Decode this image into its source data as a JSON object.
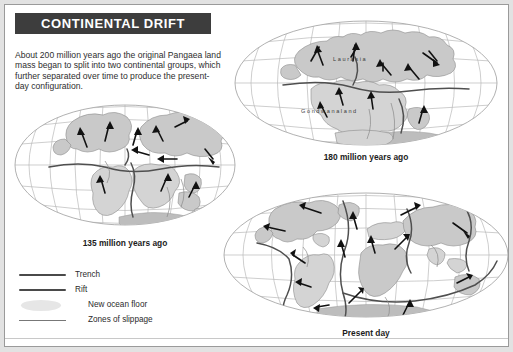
{
  "header": {
    "title": "CONTINENTAL DRIFT"
  },
  "intro": {
    "text": "About 200 million years ago the original Pangaea land mass began to split into two continental groups, which further separated over time to produce the present-day configuration."
  },
  "maps": {
    "early": {
      "caption": "180 million years ago",
      "labels": {
        "north": "Laurasia",
        "south": "Gondwanaland"
      }
    },
    "middle": {
      "caption": "135 million years ago"
    },
    "present": {
      "caption": "Present day"
    }
  },
  "legend": {
    "items": [
      {
        "label": "Trench",
        "style": "thick-line"
      },
      {
        "label": "Rift",
        "style": "thick-line"
      },
      {
        "label": "New ocean floor",
        "style": "blob"
      },
      {
        "label": "Zones of slippage",
        "style": "thin-line"
      }
    ]
  },
  "colors": {
    "title_bar": "#3d3d3d",
    "title_text": "#ffffff",
    "page_background": "#e2e2e2",
    "panel_background": "#ffffff",
    "land": "#c9c9c9",
    "graticule": "#b9b9b9",
    "boundary": "#4f4f4f",
    "arrow": "#111111"
  }
}
